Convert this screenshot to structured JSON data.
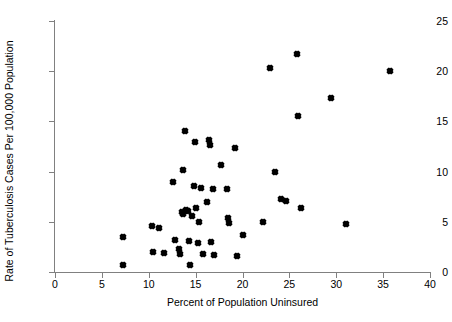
{
  "chart_data": {
    "type": "scatter",
    "title": "",
    "xlabel": "Percent of Population Uninsured",
    "ylabel": "Rate of Tuberculosis Cases Per 100,000 Population",
    "xlim": [
      0,
      40
    ],
    "ylim": [
      0,
      25
    ],
    "xticks": [
      0,
      5,
      10,
      15,
      20,
      25,
      30,
      35,
      40
    ],
    "yticks": [
      0,
      5,
      10,
      15,
      20,
      25
    ],
    "grid": false,
    "legend": null,
    "marker": "diamond",
    "marker_color": "#000000",
    "points": [
      {
        "x": 7.3,
        "y": 3.5
      },
      {
        "x": 7.3,
        "y": 0.7
      },
      {
        "x": 10.3,
        "y": 4.6
      },
      {
        "x": 10.4,
        "y": 2.0
      },
      {
        "x": 11.1,
        "y": 4.4
      },
      {
        "x": 11.6,
        "y": 1.9
      },
      {
        "x": 12.6,
        "y": 9.0
      },
      {
        "x": 12.8,
        "y": 3.2
      },
      {
        "x": 13.2,
        "y": 2.3
      },
      {
        "x": 13.3,
        "y": 1.8
      },
      {
        "x": 13.5,
        "y": 6.0
      },
      {
        "x": 13.6,
        "y": 5.8
      },
      {
        "x": 13.7,
        "y": 10.2
      },
      {
        "x": 13.9,
        "y": 14.0
      },
      {
        "x": 14.0,
        "y": 6.2
      },
      {
        "x": 14.2,
        "y": 6.1
      },
      {
        "x": 14.3,
        "y": 3.1
      },
      {
        "x": 14.4,
        "y": 0.7
      },
      {
        "x": 14.6,
        "y": 5.6
      },
      {
        "x": 14.8,
        "y": 8.6
      },
      {
        "x": 14.9,
        "y": 12.9
      },
      {
        "x": 15.0,
        "y": 6.4
      },
      {
        "x": 15.2,
        "y": 2.9
      },
      {
        "x": 15.4,
        "y": 5.0
      },
      {
        "x": 15.6,
        "y": 8.4
      },
      {
        "x": 15.8,
        "y": 1.8
      },
      {
        "x": 16.2,
        "y": 7.0
      },
      {
        "x": 16.4,
        "y": 13.1
      },
      {
        "x": 16.5,
        "y": 12.6
      },
      {
        "x": 16.6,
        "y": 3.0
      },
      {
        "x": 16.8,
        "y": 8.3
      },
      {
        "x": 17.0,
        "y": 1.7
      },
      {
        "x": 17.7,
        "y": 10.7
      },
      {
        "x": 18.3,
        "y": 8.3
      },
      {
        "x": 18.4,
        "y": 5.4
      },
      {
        "x": 18.6,
        "y": 4.9
      },
      {
        "x": 19.2,
        "y": 12.4
      },
      {
        "x": 19.4,
        "y": 1.6
      },
      {
        "x": 20.0,
        "y": 3.7
      },
      {
        "x": 22.2,
        "y": 5.0
      },
      {
        "x": 22.9,
        "y": 20.3
      },
      {
        "x": 23.5,
        "y": 10.0
      },
      {
        "x": 24.1,
        "y": 7.3
      },
      {
        "x": 24.6,
        "y": 7.1
      },
      {
        "x": 25.8,
        "y": 21.7
      },
      {
        "x": 25.9,
        "y": 15.5
      },
      {
        "x": 26.2,
        "y": 6.4
      },
      {
        "x": 29.4,
        "y": 17.3
      },
      {
        "x": 31.0,
        "y": 4.8
      },
      {
        "x": 35.7,
        "y": 20.0
      }
    ]
  }
}
